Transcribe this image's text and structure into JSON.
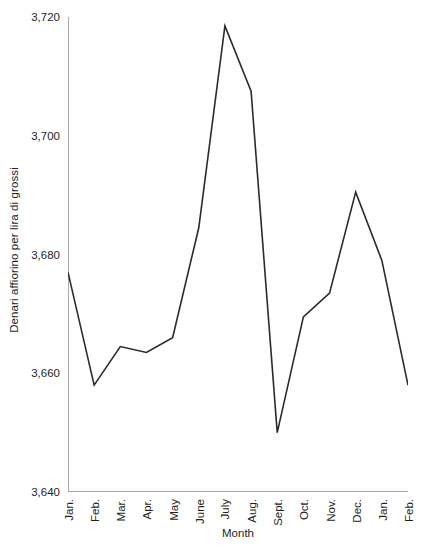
{
  "chart_data": {
    "type": "line",
    "title": "",
    "xlabel": "Month",
    "ylabel": "Denari affiorino per lira di grossi",
    "categories": [
      "Jan.",
      "Feb.",
      "Mar.",
      "Apr.",
      "May",
      "June",
      "July",
      "Aug.",
      "Sept.",
      "Oct.",
      "Nov.",
      "Dec.",
      "Jan.",
      "Feb."
    ],
    "values": [
      3677,
      3658,
      3664.5,
      3663.5,
      3666,
      3684.5,
      3718.5,
      3707.5,
      3650,
      3669.5,
      3673.5,
      3690.5,
      3679,
      3658
    ],
    "series": [
      {
        "name": "Denari affiorino per lira di grossi",
        "values": [
          3677,
          3658,
          3664.5,
          3663.5,
          3666,
          3684.5,
          3718.5,
          3707.5,
          3650,
          3669.5,
          3673.5,
          3690.5,
          3679,
          3658
        ]
      }
    ],
    "ylim": [
      3640,
      3720
    ],
    "ytick_values": [
      3640,
      3660,
      3680,
      3700,
      3720
    ],
    "ytick_labels": [
      "3,640",
      "3,660",
      "3,680",
      "3,700",
      "3,720"
    ],
    "yminor_tick_values": [
      3650,
      3670,
      3690,
      3710
    ],
    "grid": false,
    "legend": false,
    "legend_position": "none",
    "line_color": "#2b2b2b",
    "axis_color": "#a8a8a8",
    "text_color": "#231f20",
    "background_color": "#ffffff"
  }
}
